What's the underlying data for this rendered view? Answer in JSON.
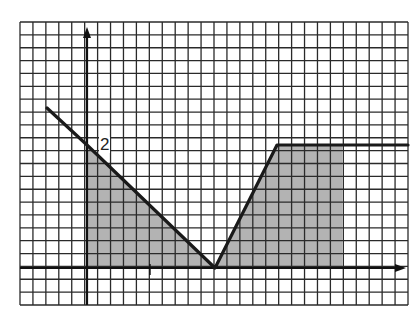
{
  "chart_data": {
    "type": "line",
    "title": "",
    "xlabel": "",
    "ylabel": "",
    "grid": true,
    "grid_units": {
      "cell_px": 12.9,
      "x_range_cells": [
        -5.2,
        24.9
      ],
      "y_range_cells": [
        -2.8,
        19.2
      ]
    },
    "annotations": [
      {
        "text": "2",
        "at_cell": [
          0,
          9.5
        ],
        "meaning": "y-intercept value"
      }
    ],
    "series": [
      {
        "name": "piecewise function",
        "points_cells": [
          [
            -3.1,
            12.4
          ],
          [
            0,
            9.5
          ],
          [
            10,
            0
          ],
          [
            14.8,
            9.5
          ],
          [
            24.9,
            9.5
          ]
        ]
      }
    ],
    "shaded_regions": [
      {
        "name": "left triangle",
        "polygon_cells": [
          [
            0,
            0
          ],
          [
            0,
            9.5
          ],
          [
            10,
            0
          ]
        ]
      },
      {
        "name": "right trapezoid",
        "polygon_cells": [
          [
            10,
            0
          ],
          [
            14.8,
            9.5
          ],
          [
            19.9,
            9.5
          ],
          [
            19.9,
            0
          ]
        ]
      }
    ],
    "axes": {
      "x_axis_arrow": true,
      "y_axis_arrow": true
    }
  },
  "labels": {
    "y_intercept": "2"
  },
  "colors": {
    "grid": "#2a2a2a",
    "shade": "#b3b3b3",
    "line": "#1a1a1a",
    "background": "#ffffff"
  }
}
